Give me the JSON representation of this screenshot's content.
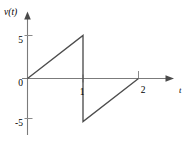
{
  "chart_data": {
    "type": "line",
    "title": "",
    "xlabel": "t",
    "ylabel": "v(t)",
    "xlim": [
      -0.18,
      2.45
    ],
    "ylim": [
      -7.6,
      7.2
    ],
    "grid": false,
    "legend": null,
    "x_tick_labels": [
      "1",
      "2"
    ],
    "x_tick_values": [
      1,
      2
    ],
    "y_tick_labels": [
      "5",
      "0",
      "-5"
    ],
    "y_tick_values": [
      5,
      0,
      -5
    ],
    "origin_label": "0",
    "series": [
      {
        "name": "v(t)",
        "comment": "sawtooth: ramp 0 to 5 over t=0..1, jump to -5, ramp -5 to 0 over t=1..2",
        "x": [
          0,
          1,
          1,
          2
        ],
        "values": [
          0,
          5,
          -5,
          0
        ]
      }
    ]
  },
  "labels": {
    "y_axis": "v(t)",
    "x_axis": "t",
    "y_tick_5": "5",
    "y_tick_0": "0",
    "y_tick_neg5": "-5",
    "x_tick_1": "1",
    "x_tick_2": "2"
  },
  "colors": {
    "background": "#ffffff",
    "axis": "#7b7b7b",
    "waveform": "#4d4d4d",
    "text": "#4f4f4f",
    "tick": "#8a8a8a"
  }
}
